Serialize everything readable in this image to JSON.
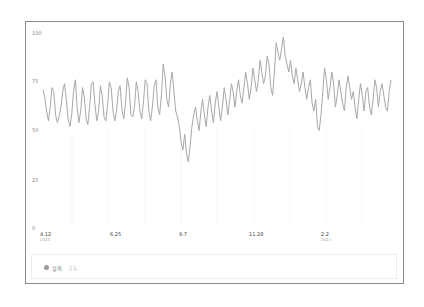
{
  "chart_data": {
    "type": "line",
    "title": "",
    "xlabel": "",
    "ylabel": "",
    "ylim": [
      0,
      100
    ],
    "yticks": [
      0,
      25,
      50,
      75,
      100
    ],
    "xticks": [
      {
        "label": "4.12",
        "sub": "2020"
      },
      {
        "label": "6.25",
        "sub": ""
      },
      {
        "label": "9.7",
        "sub": ""
      },
      {
        "label": "11.28",
        "sub": ""
      },
      {
        "label": "2.2",
        "sub": "2021"
      }
    ],
    "grid": false,
    "legend_position": "bottom",
    "series": [
      {
        "name": "실제",
        "color": "#a8a8a8",
        "values": [
          71,
          67,
          60,
          55,
          62,
          72,
          70,
          58,
          54,
          57,
          62,
          70,
          74,
          66,
          56,
          52,
          58,
          70,
          76,
          62,
          54,
          60,
          72,
          67,
          56,
          53,
          62,
          74,
          75,
          63,
          55,
          60,
          73,
          68,
          57,
          55,
          63,
          75,
          72,
          60,
          55,
          60,
          70,
          73,
          61,
          56,
          64,
          77,
          72,
          58,
          57,
          62,
          75,
          70,
          60,
          56,
          65,
          76,
          74,
          60,
          55,
          62,
          73,
          76,
          62,
          58,
          68,
          84,
          78,
          66,
          62,
          74,
          80,
          70,
          60,
          57,
          52,
          44,
          40,
          48,
          38,
          34,
          42,
          52,
          58,
          62,
          55,
          50,
          60,
          66,
          58,
          52,
          62,
          68,
          60,
          54,
          64,
          70,
          62,
          55,
          62,
          72,
          66,
          58,
          65,
          74,
          70,
          62,
          70,
          76,
          68,
          64,
          72,
          80,
          74,
          66,
          72,
          82,
          76,
          70,
          76,
          86,
          80,
          74,
          78,
          88,
          84,
          72,
          68,
          80,
          95,
          90,
          86,
          92,
          98,
          88,
          84,
          80,
          86,
          78,
          74,
          82,
          76,
          70,
          74,
          80,
          72,
          66,
          72,
          76,
          64,
          60,
          66,
          52,
          50,
          58,
          70,
          82,
          76,
          66,
          72,
          80,
          74,
          62,
          68,
          76,
          70,
          64,
          60,
          72,
          78,
          72,
          66,
          70,
          62,
          56,
          66,
          74,
          68,
          60,
          70,
          72,
          62,
          58,
          66,
          76,
          72,
          62,
          70,
          74,
          68,
          62,
          60,
          70,
          76
        ]
      }
    ]
  },
  "legend": {
    "items": [
      {
        "label": "실제"
      },
      {
        "label": "고두"
      }
    ]
  },
  "axis": {
    "y": [
      "100",
      "75",
      "50",
      "25",
      "0"
    ],
    "x": [
      "4.12",
      "6.25",
      "9.7",
      "11.28",
      "2.2"
    ],
    "x_years": [
      "2020",
      "2021"
    ]
  }
}
